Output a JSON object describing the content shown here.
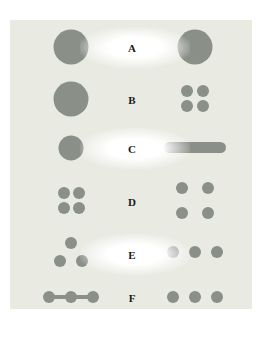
{
  "figure": {
    "fill_color": "#8a8f88",
    "background_color": "#e9ebe3",
    "rows": [
      {
        "label": "A",
        "left": "one large circle",
        "right": "one large circle"
      },
      {
        "label": "B",
        "left": "one large circle",
        "right": "four small circles in 2x2 cluster"
      },
      {
        "label": "C",
        "left": "one medium circle",
        "right": "elongated horizontal bar"
      },
      {
        "label": "D",
        "left": "four small circles in tight 2x2 cluster",
        "right": "four small circles in spread 2x2"
      },
      {
        "label": "E",
        "left": "three circles in triangle",
        "right": "three circles in a row"
      },
      {
        "label": "F",
        "left": "three circles connected by line",
        "right": "three circles in a row"
      }
    ]
  }
}
